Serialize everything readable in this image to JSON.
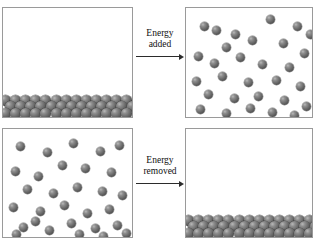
{
  "figure": {
    "caption_fragment": "",
    "panels": [
      {
        "id": "panel-solid-top",
        "name": "solid-state-panel-top-left",
        "state": "solid",
        "description": "Closely packed particles arranged in ordered rows at the bottom of the container",
        "particle_count": 81,
        "lattice_rows": 3,
        "lattice_columns": 27
      },
      {
        "id": "panel-gas-top",
        "name": "gas-state-panel-top-right",
        "state": "gas",
        "description": "Widely separated particles randomly distributed throughout the container",
        "particle_count": 30
      },
      {
        "id": "panel-gas-bottom",
        "name": "gas-state-panel-bottom-left",
        "state": "gas",
        "description": "Widely separated particles randomly distributed throughout the container",
        "particle_count": 30
      },
      {
        "id": "panel-solid-bottom",
        "name": "solid-state-panel-bottom-right",
        "state": "solid",
        "description": "Closely packed particles arranged in ordered rows at the bottom of the container",
        "particle_count": 81,
        "lattice_rows": 3,
        "lattice_columns": 27
      }
    ],
    "arrows": [
      {
        "id": "arrow-energy-added",
        "name": "energy-added-arrow",
        "label_line1": "Energy",
        "label_line2": "added",
        "direction": "right",
        "from_panel": "panel-solid-top",
        "to_panel": "panel-gas-top"
      },
      {
        "id": "arrow-energy-removed",
        "name": "energy-removed-arrow",
        "label_line1": "Energy",
        "label_line2": "removed",
        "direction": "right",
        "from_panel": "panel-gas-bottom",
        "to_panel": "panel-solid-bottom"
      }
    ]
  },
  "colors": {
    "background": "#ffffff",
    "panel_border": "#9a9a9a",
    "particle_dark": "#3a3a3a",
    "particle_mid": "#6a6a6a",
    "particle_highlight": "#b9b9b9",
    "arrow": "#2b2b2b",
    "text": "#111111"
  },
  "gas_positions_top_right": [
    [
      14,
      14
    ],
    [
      45,
      22
    ],
    [
      80,
      7
    ],
    [
      107,
      14
    ],
    [
      36,
      35
    ],
    [
      62,
      28
    ],
    [
      8,
      44
    ],
    [
      93,
      31
    ],
    [
      114,
      41
    ],
    [
      24,
      51
    ],
    [
      50,
      45
    ],
    [
      72,
      52
    ],
    [
      99,
      55
    ],
    [
      6,
      69
    ],
    [
      32,
      64
    ],
    [
      58,
      70
    ],
    [
      86,
      68
    ],
    [
      110,
      74
    ],
    [
      18,
      82
    ],
    [
      44,
      86
    ],
    [
      68,
      84
    ],
    [
      94,
      88
    ],
    [
      116,
      94
    ],
    [
      10,
      97
    ],
    [
      36,
      101
    ],
    [
      60,
      96
    ],
    [
      82,
      100
    ],
    [
      104,
      103
    ],
    [
      26,
      18
    ],
    [
      120,
      22
    ]
  ],
  "gas_positions_bottom_left": [
    [
      13,
      13
    ],
    [
      40,
      19
    ],
    [
      66,
      10
    ],
    [
      93,
      18
    ],
    [
      112,
      12
    ],
    [
      8,
      38
    ],
    [
      31,
      43
    ],
    [
      55,
      32
    ],
    [
      78,
      35
    ],
    [
      104,
      39
    ],
    [
      20,
      56
    ],
    [
      46,
      60
    ],
    [
      70,
      54
    ],
    [
      95,
      58
    ],
    [
      115,
      62
    ],
    [
      6,
      74
    ],
    [
      33,
      78
    ],
    [
      57,
      72
    ],
    [
      80,
      80
    ],
    [
      102,
      76
    ],
    [
      16,
      94
    ],
    [
      42,
      97
    ],
    [
      64,
      90
    ],
    [
      88,
      95
    ],
    [
      110,
      92
    ],
    [
      9,
      101
    ],
    [
      28,
      88
    ],
    [
      72,
      101
    ],
    [
      96,
      103
    ],
    [
      119,
      100
    ]
  ]
}
